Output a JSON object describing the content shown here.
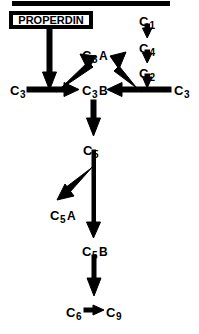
{
  "diagram": {
    "background_color": "#ffffff",
    "stroke_color": "#000000",
    "top_rule": {
      "name": "top-rule"
    },
    "boxed_label": {
      "text": "PROPERDIN",
      "border_color": "#000000",
      "fill_color": "#ffffff"
    },
    "nodes": [
      {
        "id": "c3_left",
        "base": "C",
        "sub": "3",
        "suffix": "",
        "x": 10,
        "y": 82
      },
      {
        "id": "c3a",
        "base": "C",
        "sub": "3",
        "suffix": "A",
        "x": 82,
        "y": 47
      },
      {
        "id": "c3b",
        "base": "C",
        "sub": "3",
        "suffix": "B",
        "x": 82,
        "y": 82
      },
      {
        "id": "c3_right",
        "base": "C",
        "sub": "3",
        "suffix": "",
        "x": 174,
        "y": 82
      },
      {
        "id": "c1",
        "base": "C",
        "sub": "",
        "suffix": "",
        "x": 139,
        "y": 13,
        "sup": "1"
      },
      {
        "id": "c4",
        "base": "C",
        "sub": "",
        "suffix": "",
        "x": 139,
        "y": 40,
        "sup": "4"
      },
      {
        "id": "c2",
        "base": "C",
        "sub": "",
        "suffix": "",
        "x": 139,
        "y": 65,
        "sup": "2"
      },
      {
        "id": "c5",
        "base": "C",
        "sub": "5",
        "suffix": "",
        "x": 83,
        "y": 142
      },
      {
        "id": "c5a",
        "base": "C",
        "sub": "5",
        "suffix": "A",
        "x": 50,
        "y": 207
      },
      {
        "id": "c5b",
        "base": "C",
        "sub": "5",
        "suffix": "B",
        "x": 82,
        "y": 243
      },
      {
        "id": "c6",
        "base": "C",
        "sub": "6",
        "suffix": "",
        "x": 66,
        "y": 305
      },
      {
        "id": "c9",
        "base": "C",
        "sub": "9",
        "suffix": "",
        "x": 106,
        "y": 305
      }
    ],
    "arrows": [
      {
        "id": "properdin-to-backbone",
        "direction": "down"
      },
      {
        "id": "c1-to-c4",
        "direction": "down"
      },
      {
        "id": "c4-to-c2",
        "direction": "down"
      },
      {
        "id": "c2-to-backbone",
        "direction": "down"
      },
      {
        "id": "c3left-to-c3b",
        "direction": "right"
      },
      {
        "id": "c3right-to-c3b",
        "direction": "left"
      },
      {
        "id": "left-branch-to-c3a",
        "direction": "up-right"
      },
      {
        "id": "right-branch-to-c3a",
        "direction": "up-left"
      },
      {
        "id": "c3b-to-c5",
        "direction": "down"
      },
      {
        "id": "c5-to-c5a",
        "direction": "down-left"
      },
      {
        "id": "c5-to-c5b",
        "direction": "down"
      },
      {
        "id": "c5b-to-c6",
        "direction": "down"
      },
      {
        "id": "c6-to-c9",
        "direction": "right"
      }
    ]
  }
}
